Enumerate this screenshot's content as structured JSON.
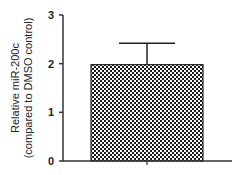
{
  "chart_data": {
    "type": "bar",
    "title": "",
    "xlabel": "",
    "ylabel": "Relative miR-200c",
    "ylabel_line2": "(compared to DMSO control)",
    "categories": [
      ""
    ],
    "values": [
      1.98
    ],
    "error_upper": [
      2.42
    ],
    "ylim": [
      0,
      3
    ],
    "yticks": [
      "0",
      "1",
      "2",
      "3"
    ],
    "grid": false,
    "legend": "none",
    "bar_pattern": "checkerboard",
    "colors": {
      "axis": "#333333",
      "bar_fill_dark": "#1a1a1a",
      "bar_fill_light": "#ffffff"
    }
  }
}
